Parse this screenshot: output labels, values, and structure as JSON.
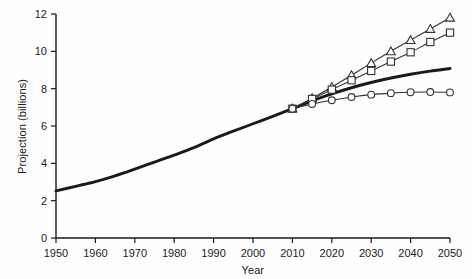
{
  "chart_data": {
    "type": "line",
    "title": "",
    "xlabel": "Year",
    "ylabel": "Projection (billions)",
    "xlim": [
      1950,
      2050
    ],
    "ylim": [
      0,
      12
    ],
    "xticks": [
      1950,
      1960,
      1970,
      1980,
      1990,
      2000,
      2010,
      2020,
      2030,
      2040,
      2050
    ],
    "yticks": [
      0,
      2,
      4,
      6,
      8,
      10,
      12
    ],
    "grid": false,
    "legend": "none",
    "series": [
      {
        "name": "historical-and-medium-projection",
        "marker": "none",
        "style": "thick-solid",
        "color": "#1a1a1a",
        "x": [
          1950,
          1955,
          1960,
          1965,
          1970,
          1975,
          1980,
          1985,
          1990,
          1995,
          2000,
          2005,
          2010,
          2015,
          2020,
          2025,
          2030,
          2035,
          2040,
          2045,
          2050
        ],
        "values": [
          2.52,
          2.77,
          3.02,
          3.33,
          3.69,
          4.07,
          4.44,
          4.84,
          5.31,
          5.72,
          6.12,
          6.52,
          6.93,
          7.35,
          7.72,
          8.05,
          8.33,
          8.57,
          8.77,
          8.94,
          9.08
        ]
      },
      {
        "name": "high-variant",
        "marker": "triangle",
        "style": "thin-solid",
        "color": "#333333",
        "x": [
          2010,
          2015,
          2020,
          2025,
          2030,
          2035,
          2040,
          2045,
          2050
        ],
        "values": [
          6.93,
          7.49,
          8.09,
          8.72,
          9.37,
          10.0,
          10.6,
          11.2,
          11.8
        ]
      },
      {
        "name": "medium-high-variant",
        "marker": "square",
        "style": "thin-solid",
        "color": "#333333",
        "x": [
          2010,
          2015,
          2020,
          2025,
          2030,
          2035,
          2040,
          2045,
          2050
        ],
        "values": [
          6.93,
          7.45,
          7.95,
          8.45,
          8.95,
          9.45,
          9.95,
          10.5,
          11.0
        ]
      },
      {
        "name": "low-variant",
        "marker": "circle",
        "style": "thin-solid",
        "color": "#333333",
        "x": [
          2010,
          2015,
          2020,
          2025,
          2030,
          2035,
          2040,
          2045,
          2050
        ],
        "values": [
          6.93,
          7.18,
          7.38,
          7.55,
          7.68,
          7.76,
          7.81,
          7.82,
          7.8
        ]
      }
    ]
  },
  "axes": {
    "x_title": "Year",
    "y_title": "Projection (billions)"
  }
}
